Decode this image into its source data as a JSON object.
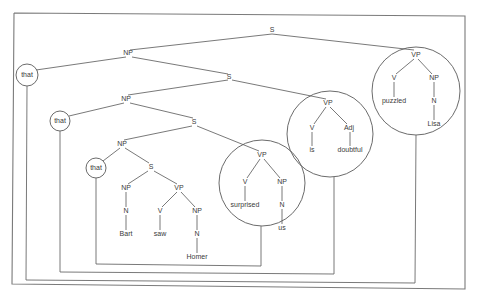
{
  "diagram": {
    "nodes": {
      "root_s": "S",
      "np1": "NP",
      "that1": "that",
      "s2": "S",
      "np2": "NP",
      "that2": "that",
      "s3": "S",
      "np3": "NP",
      "that3": "that",
      "s4": "S",
      "np_bart": "NP",
      "n_bart": "N",
      "bart": "Bart",
      "vp_saw": "VP",
      "v_saw": "V",
      "saw": "saw",
      "np_homer": "NP",
      "n_homer": "N",
      "homer": "Homer",
      "vp_surprised": "VP",
      "v_surprised": "V",
      "surprised": "surprised",
      "np_us": "NP",
      "n_us": "N",
      "us": "us",
      "vp_doubtful": "VP",
      "v_is": "V",
      "is": "is",
      "adj": "Adj",
      "doubtful": "doubtful",
      "vp_puzzled": "VP",
      "v_puzzled": "V",
      "puzzled": "puzzled",
      "np_lisa": "NP",
      "n_lisa": "N",
      "lisa": "Lisa"
    },
    "links": [
      {
        "from": "that3",
        "to": "vp_surprised"
      },
      {
        "from": "that2",
        "to": "vp_doubtful"
      },
      {
        "from": "that1",
        "to": "vp_puzzled"
      }
    ],
    "colors": {
      "line": "#6a6a6a",
      "text": "#3a3a3a",
      "background": "#ffffff"
    }
  }
}
